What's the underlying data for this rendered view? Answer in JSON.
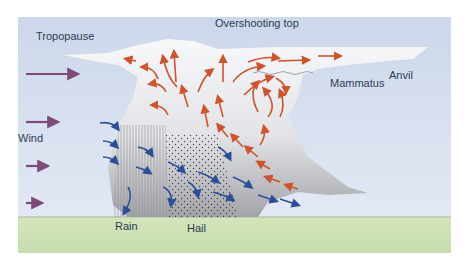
{
  "diagram": {
    "labels": {
      "tropopause": "Tropopause",
      "overshooting_top": "Overshooting top",
      "mammatus": "Mammatus",
      "anvil": "Anvil",
      "wind": "Wind",
      "rain": "Rain",
      "hail": "Hail"
    },
    "colors": {
      "sky": "#d6dff0",
      "ground": "#cfe0b4",
      "cloud_white": "#f4f5f7",
      "cloud_grey": "#a9aaad",
      "updraft_arrow": "#d2522a",
      "downdraft_arrow": "#2d4f9a",
      "wind_arrow": "#7d4a7a"
    },
    "wind_arrow_count": 4,
    "updraft_arrows": "red/orange arrows rising and spreading under anvil",
    "downdraft_arrows": "blue arrows descending toward ground"
  }
}
